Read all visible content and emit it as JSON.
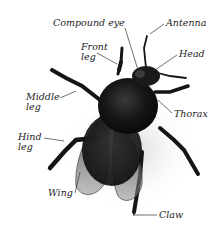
{
  "diagram": {
    "labels": [
      {
        "id": "compound-eye",
        "text": "Compound eye",
        "x": 53,
        "y": 18
      },
      {
        "id": "antenna",
        "text": "Antenna",
        "x": 166,
        "y": 18
      },
      {
        "id": "front-leg",
        "text": "Front\nleg",
        "x": 81,
        "y": 42
      },
      {
        "id": "head",
        "text": "Head",
        "x": 179,
        "y": 49
      },
      {
        "id": "middle-leg",
        "text": "Middle\nleg",
        "x": 26,
        "y": 92
      },
      {
        "id": "thorax",
        "text": "Thorax",
        "x": 174,
        "y": 109
      },
      {
        "id": "hind-leg",
        "text": "Hind\nleg",
        "x": 18,
        "y": 132
      },
      {
        "id": "wing",
        "text": "Wing",
        "x": 48,
        "y": 188
      },
      {
        "id": "claw",
        "text": "Claw",
        "x": 159,
        "y": 205
      }
    ],
    "colors": {
      "background": "#ffffff",
      "body": "#141414",
      "wing": "#6a6a6a",
      "leader_line": "#333333",
      "label_text": "#222222"
    }
  }
}
